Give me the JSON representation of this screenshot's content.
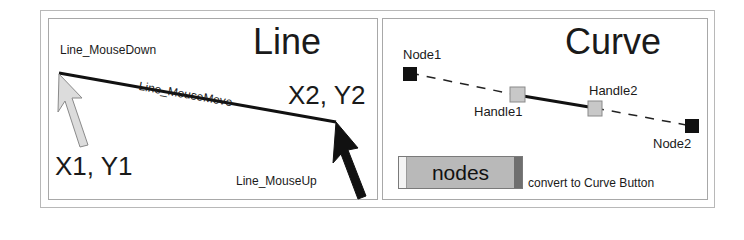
{
  "line_panel": {
    "title": "Line",
    "labels": {
      "mouse_down": "Line_MouseDown",
      "mouse_move": "Line_MouseMove",
      "mouse_up": "Line_MouseUp",
      "start_coord": "X1, Y1",
      "end_coord": "X2, Y2"
    },
    "icons": [
      "cursor-start-icon",
      "cursor-end-icon"
    ]
  },
  "curve_panel": {
    "title": "Curve",
    "labels": {
      "node1": "Node1",
      "node2": "Node2",
      "handle1": "Handle1",
      "handle2": "Handle2"
    },
    "button": {
      "label": "nodes",
      "caption": "convert to Curve Button"
    }
  },
  "colors": {
    "node": "#111111",
    "handle": "#c8c8c8",
    "cursor_start": "#d8d8d8",
    "cursor_end": "#111111",
    "button_face": "#b9b9b9"
  }
}
